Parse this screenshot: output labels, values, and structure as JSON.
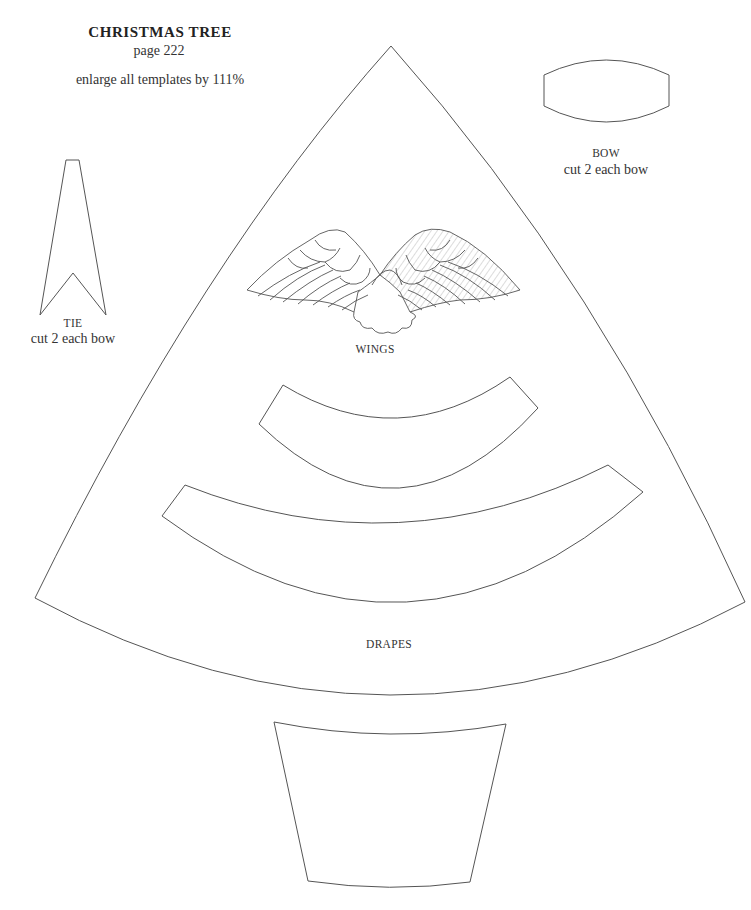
{
  "header": {
    "title": "CHRISTMAS TREE",
    "page": "page 222",
    "instruction": "enlarge all templates by 111%"
  },
  "templates": {
    "bow": {
      "label": "BOW",
      "note": "cut 2 each bow"
    },
    "tie": {
      "label": "TIE",
      "note": "cut 2 each bow"
    },
    "wings": {
      "label": "WINGS"
    },
    "drapes": {
      "label": "DRAPES"
    }
  },
  "colors": {
    "line": "#555555",
    "hatch": "#9a9a9a",
    "background": "#ffffff"
  }
}
